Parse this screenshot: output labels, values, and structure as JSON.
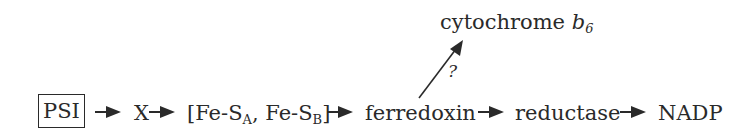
{
  "diagram": {
    "title": "",
    "nodes": {
      "psi": "PSI",
      "x": "X",
      "fes": {
        "open": "[Fe-S",
        "sub_a": "A",
        "sep": ", Fe-S",
        "sub_b": "B",
        "close": "]"
      },
      "ferredoxin": "ferredoxin",
      "reductase": "reductase",
      "nadp": "NADP",
      "cytochrome": {
        "text": "cytochrome ",
        "italic": "b",
        "sub": "6"
      }
    },
    "branch_label": "?",
    "edges": [
      {
        "from": "PSI",
        "to": "X"
      },
      {
        "from": "X",
        "to": "[Fe-SA, Fe-SB]"
      },
      {
        "from": "[Fe-SA, Fe-SB]",
        "to": "ferredoxin"
      },
      {
        "from": "ferredoxin",
        "to": "reductase"
      },
      {
        "from": "reductase",
        "to": "NADP"
      },
      {
        "from": "ferredoxin",
        "to": "cytochrome b6",
        "label": "?"
      }
    ]
  }
}
